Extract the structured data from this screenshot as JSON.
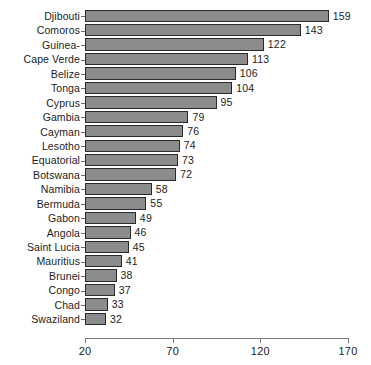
{
  "chart_data": {
    "type": "bar",
    "orientation": "horizontal",
    "title": "",
    "xlabel": "",
    "ylabel": "",
    "xlim": [
      20,
      170
    ],
    "xticks": [
      20,
      70,
      120,
      170
    ],
    "grid": false,
    "legend": null,
    "bar_color": "#8c8c8c",
    "bar_edge_color": "#2a2a2a",
    "show_value_labels": true,
    "categories": [
      "Djibouti",
      "Comoros",
      "Guinea-",
      "Cape Verde",
      "Belize",
      "Tonga",
      "Cyprus",
      "Gambia",
      "Cayman",
      "Lesotho",
      "Equatorial",
      "Botswana",
      "Namibia",
      "Bermuda",
      "Gabon",
      "Angola",
      "Saint Lucia",
      "Mauritius",
      "Brunei",
      "Congo",
      "Chad",
      "Swaziland"
    ],
    "values": [
      159,
      143,
      122,
      113,
      106,
      104,
      95,
      79,
      76,
      74,
      73,
      72,
      58,
      55,
      49,
      46,
      45,
      41,
      38,
      37,
      33,
      32
    ]
  }
}
